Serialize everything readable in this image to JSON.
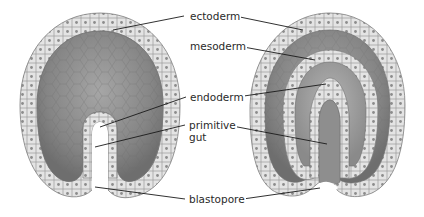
{
  "diagram": {
    "title": "",
    "panels": [
      {
        "name": "early-gastrula",
        "description": "Embryo with invaginating primitive gut"
      },
      {
        "name": "late-gastrula",
        "description": "Embryo with three germ layers"
      }
    ],
    "labels": {
      "ectoderm": "ectoderm",
      "mesoderm": "mesoderm",
      "endoderm": "endoderm",
      "primitive_line1": "primitive",
      "primitive_line2": "gut",
      "blastopore": "blastopore"
    },
    "colors": {
      "cell_fill": "#e4e4e4",
      "cell_stroke": "#8a8a8a",
      "nucleus": "#8c8c8c",
      "interior_dark": "#7a7a7a",
      "interior_mid": "#9a9a9a",
      "leader_line": "#1a1a1a",
      "text": "#2a2a2a"
    }
  }
}
